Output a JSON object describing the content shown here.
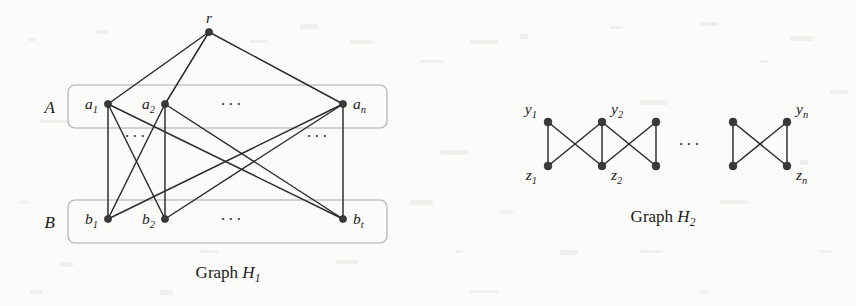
{
  "figure": {
    "background_color": "#fbfbfa",
    "edge_color": "#2a2a2a",
    "node_color": "#3a3a3a",
    "box_color": "#a9a9a9"
  },
  "graph_h1": {
    "caption": "Graph",
    "caption_name": "H",
    "caption_sub": "1",
    "root": {
      "id": "r",
      "label": "r",
      "sub": "",
      "x": 209,
      "y": 32
    },
    "set_a": {
      "label": "A",
      "box": {
        "x": 68,
        "y": 85,
        "width": 319,
        "height": 43
      },
      "ellipsis": "···",
      "ellipsis_x": 232,
      "ellipsis_y": 110,
      "nodes": [
        {
          "id": "a1",
          "label": "a",
          "sub": "1",
          "x": 108,
          "y": 104,
          "label_side": "left"
        },
        {
          "id": "a2",
          "label": "a",
          "sub": "2",
          "x": 165,
          "y": 104,
          "label_side": "left"
        },
        {
          "id": "an",
          "label": "a",
          "sub": "n",
          "x": 343,
          "y": 104,
          "label_side": "right"
        }
      ]
    },
    "set_b": {
      "label": "B",
      "box": {
        "x": 68,
        "y": 200,
        "width": 319,
        "height": 43
      },
      "ellipsis": "···",
      "ellipsis_x": 232,
      "ellipsis_y": 225,
      "nodes": [
        {
          "id": "b1",
          "label": "b",
          "sub": "1",
          "x": 108,
          "y": 219,
          "label_side": "left"
        },
        {
          "id": "b2",
          "label": "b",
          "sub": "2",
          "x": 165,
          "y": 219,
          "label_side": "left"
        },
        {
          "id": "bt",
          "label": "b",
          "sub": "t",
          "x": 343,
          "y": 219,
          "label_side": "right"
        }
      ]
    },
    "middle_ellipses": [
      {
        "text": "···",
        "x": 136,
        "y": 142
      },
      {
        "text": "···",
        "x": 318,
        "y": 142
      }
    ],
    "edges": [
      {
        "from": "r",
        "to": "a1"
      },
      {
        "from": "r",
        "to": "a2"
      },
      {
        "from": "r",
        "to": "an"
      },
      {
        "from": "a1",
        "to": "b1"
      },
      {
        "from": "a1",
        "to": "b2"
      },
      {
        "from": "a1",
        "to": "bt"
      },
      {
        "from": "a2",
        "to": "b1"
      },
      {
        "from": "a2",
        "to": "b2"
      },
      {
        "from": "a2",
        "to": "bt"
      },
      {
        "from": "an",
        "to": "b1"
      },
      {
        "from": "an",
        "to": "b2"
      },
      {
        "from": "an",
        "to": "bt"
      }
    ]
  },
  "graph_h2": {
    "caption": "Graph",
    "caption_name": "H",
    "caption_sub": "2",
    "ellipsis": "···",
    "ellipsis_x": 690,
    "ellipsis_y": 150,
    "top_row_y": 122,
    "bottom_row_y": 166,
    "nodes": [
      {
        "id": "y1",
        "label": "y",
        "sub": "1",
        "x": 548,
        "y": 122,
        "label_pos": "above-left",
        "show_label": true
      },
      {
        "id": "y2",
        "label": "y",
        "sub": "2",
        "x": 602,
        "y": 122,
        "label_pos": "above-right",
        "show_label": true
      },
      {
        "id": "y3",
        "label": "",
        "sub": "",
        "x": 656,
        "y": 122,
        "label_pos": "none",
        "show_label": false
      },
      {
        "id": "ym",
        "label": "",
        "sub": "",
        "x": 733,
        "y": 122,
        "label_pos": "none",
        "show_label": false
      },
      {
        "id": "yn",
        "label": "y",
        "sub": "n",
        "x": 787,
        "y": 122,
        "label_pos": "above-right",
        "show_label": true
      },
      {
        "id": "z1",
        "label": "z",
        "sub": "1",
        "x": 548,
        "y": 166,
        "label_pos": "below-left",
        "show_label": true
      },
      {
        "id": "z2",
        "label": "z",
        "sub": "2",
        "x": 602,
        "y": 166,
        "label_pos": "below-right",
        "show_label": true
      },
      {
        "id": "z3",
        "label": "",
        "sub": "",
        "x": 656,
        "y": 166,
        "label_pos": "none",
        "show_label": false
      },
      {
        "id": "zm",
        "label": "",
        "sub": "",
        "x": 733,
        "y": 166,
        "label_pos": "none",
        "show_label": false
      },
      {
        "id": "zn",
        "label": "z",
        "sub": "n",
        "x": 787,
        "y": 166,
        "label_pos": "below-right",
        "show_label": true
      }
    ],
    "edges": [
      {
        "from": "y1",
        "to": "z1"
      },
      {
        "from": "y1",
        "to": "z2"
      },
      {
        "from": "z1",
        "to": "y2"
      },
      {
        "from": "y2",
        "to": "z2"
      },
      {
        "from": "y2",
        "to": "z3"
      },
      {
        "from": "z2",
        "to": "y3"
      },
      {
        "from": "y3",
        "to": "z3"
      },
      {
        "from": "ym",
        "to": "zm"
      },
      {
        "from": "ym",
        "to": "zn"
      },
      {
        "from": "zm",
        "to": "yn"
      },
      {
        "from": "yn",
        "to": "zn"
      }
    ]
  },
  "captions": {
    "h1": {
      "x": 228,
      "y": 278
    },
    "h2": {
      "x": 663,
      "y": 222
    }
  }
}
